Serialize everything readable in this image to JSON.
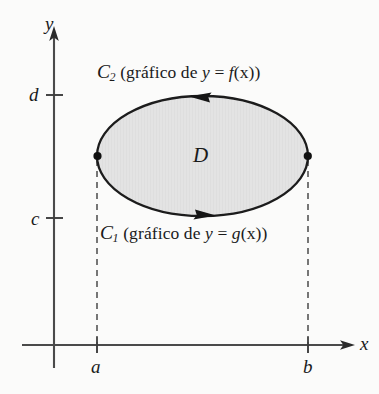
{
  "figure": {
    "background_color": "#fbfbfa",
    "ink_color": "#1a1a1a",
    "region_fill_color": "#e2e2e2"
  },
  "axes": {
    "y_axis_label": "y",
    "x_axis_label": "x",
    "y_ticks": [
      {
        "label": "d",
        "y_px": 95
      },
      {
        "label": "c",
        "y_px": 218
      }
    ],
    "x_ticks": [
      {
        "label": "a",
        "x_px": 97
      },
      {
        "label": "b",
        "x_px": 308
      }
    ],
    "origin_px": {
      "x": 54,
      "y": 345
    }
  },
  "region": {
    "label": "D",
    "ellipse": {
      "cx": 202.5,
      "cy": 156,
      "rx": 105.5,
      "ry": 60
    }
  },
  "curves": [
    {
      "name": "upper-curve",
      "curve_symbol": "C",
      "subscript": "2",
      "caption_open": " (gráfico de ",
      "variable": "y",
      "equals": " = ",
      "function": "f",
      "argument": "(x)",
      "caption_close": ")",
      "full_text": "C₂ (gráfico de y = f(x))",
      "arrow_direction": "left"
    },
    {
      "name": "lower-curve",
      "curve_symbol": "C",
      "subscript": "1",
      "caption_open": " (gráfico de ",
      "variable": "y",
      "equals": " = ",
      "function": "g",
      "argument": "(x)",
      "caption_close": ")",
      "full_text": "C₁ (gráfico de y = g(x))",
      "arrow_direction": "right"
    }
  ],
  "vertices": [
    {
      "name": "left-vertex",
      "x_px": 97,
      "y_px": 156
    },
    {
      "name": "right-vertex",
      "x_px": 308,
      "y_px": 156
    }
  ]
}
